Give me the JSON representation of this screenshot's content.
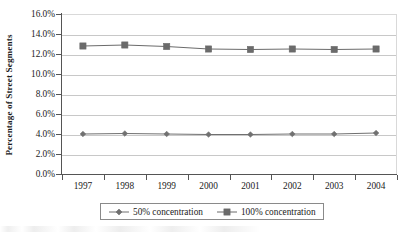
{
  "chart_data": {
    "type": "line",
    "title": "",
    "xlabel": "",
    "ylabel": "Percentage of Street Segments",
    "categories": [
      "1997",
      "1998",
      "1999",
      "2000",
      "2001",
      "2002",
      "2003",
      "2004"
    ],
    "ylim": [
      0,
      16
    ],
    "ytick_values": [
      0,
      2,
      4,
      6,
      8,
      10,
      12,
      14,
      16
    ],
    "ytick_labels": [
      "0.0%",
      "2.0%",
      "4.0%",
      "6.0%",
      "8.0%",
      "10.0%",
      "12.0%",
      "14.0%",
      "16.0%"
    ],
    "grid": true,
    "legend_position": "bottom",
    "series": [
      {
        "name": "50% concentration",
        "marker": "diamond",
        "color": "#707070",
        "values": [
          4.0,
          4.05,
          4.0,
          3.95,
          3.95,
          4.0,
          4.0,
          4.1
        ]
      },
      {
        "name": "100% concentration",
        "marker": "square",
        "color": "#6b6b6b",
        "values": [
          12.8,
          12.9,
          12.75,
          12.5,
          12.45,
          12.5,
          12.45,
          12.5
        ]
      }
    ]
  },
  "axis": {
    "y_title": "Percentage of Street Segments",
    "y_labels": [
      "16.0%",
      "14.0%",
      "12.0%",
      "10.0%",
      "8.0%",
      "6.0%",
      "4.0%",
      "2.0%",
      "0.0%"
    ],
    "x_labels": [
      "1997",
      "1998",
      "1999",
      "2000",
      "2001",
      "2002",
      "2003",
      "2004"
    ]
  },
  "legend": {
    "items": [
      {
        "label": "50% concentration",
        "marker": "diamond-marker"
      },
      {
        "label": "100% concentration",
        "marker": "square-marker"
      }
    ]
  },
  "colors": {
    "series_gray": "#6b6b6b",
    "gridline": "#c8c8c8",
    "axis": "#555555",
    "legend_border": "#8a8a8a",
    "text": "#1a1a1a"
  }
}
